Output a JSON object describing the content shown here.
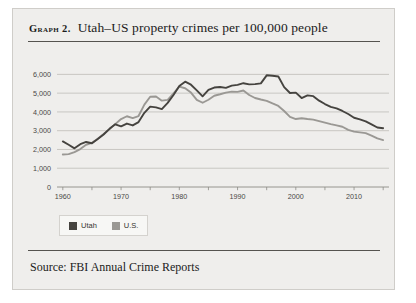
{
  "figure": {
    "label_prefix": "Graph 2.",
    "title": "Utah–US property crimes per 100,000 people",
    "source": "Source: FBI Annual Crime Reports",
    "background_color": "#efeeec",
    "rule_color": "#55534f"
  },
  "legend": {
    "position": "below-plot-left",
    "items": [
      {
        "label": "Utah",
        "color": "#45433f"
      },
      {
        "label": "U.S.",
        "color": "#9a9894"
      }
    ]
  },
  "chart_data": {
    "type": "line",
    "title": "Utah–US property crimes per 100,000 people",
    "xlabel": "",
    "ylabel": "",
    "xlim": [
      1959,
      2016
    ],
    "ylim": [
      0,
      6500
    ],
    "grid": "horizontal",
    "y_ticks": [
      0,
      1000,
      2000,
      3000,
      4000,
      5000,
      6000
    ],
    "y_tick_labels": [
      "0",
      "1,000",
      "2,000",
      "3,000",
      "4,000",
      "5,000",
      "6,000"
    ],
    "x_ticks": [
      1960,
      1970,
      1980,
      1990,
      2000,
      2010
    ],
    "x_tick_labels": [
      "1960",
      "1970",
      "1980",
      "1990",
      "2000",
      "2010"
    ],
    "x": [
      1960,
      1961,
      1962,
      1963,
      1964,
      1965,
      1966,
      1967,
      1968,
      1969,
      1970,
      1971,
      1972,
      1973,
      1974,
      1975,
      1976,
      1977,
      1978,
      1979,
      1980,
      1981,
      1982,
      1983,
      1984,
      1985,
      1986,
      1987,
      1988,
      1989,
      1990,
      1991,
      1992,
      1993,
      1994,
      1995,
      1996,
      1997,
      1998,
      1999,
      2000,
      2001,
      2002,
      2003,
      2004,
      2005,
      2006,
      2007,
      2008,
      2009,
      2010,
      2011,
      2012,
      2013,
      2014,
      2015
    ],
    "series": [
      {
        "name": "Utah",
        "color": "#45433f",
        "values": [
          2430,
          2250,
          2060,
          2280,
          2400,
          2330,
          2560,
          2800,
          3100,
          3340,
          3230,
          3380,
          3280,
          3460,
          3950,
          4280,
          4240,
          4150,
          4480,
          4900,
          5380,
          5610,
          5450,
          5150,
          4830,
          5170,
          5300,
          5330,
          5280,
          5400,
          5440,
          5530,
          5470,
          5480,
          5520,
          5950,
          5930,
          5890,
          5320,
          5010,
          5030,
          4740,
          4880,
          4840,
          4600,
          4420,
          4270,
          4190,
          4050,
          3890,
          3690,
          3600,
          3500,
          3340,
          3170,
          3130
        ]
      },
      {
        "name": "U.S.",
        "color": "#9a9894",
        "values": [
          1730,
          1750,
          1860,
          2020,
          2250,
          2350,
          2570,
          2820,
          3070,
          3350,
          3620,
          3770,
          3670,
          3780,
          4390,
          4810,
          4820,
          4600,
          4640,
          4990,
          5350,
          5260,
          5030,
          4640,
          4490,
          4650,
          4860,
          4940,
          5030,
          5080,
          5070,
          5140,
          4900,
          4740,
          4660,
          4590,
          4450,
          4320,
          4050,
          3740,
          3620,
          3660,
          3620,
          3590,
          3510,
          3430,
          3350,
          3280,
          3210,
          3040,
          2950,
          2910,
          2870,
          2740,
          2590,
          2500
        ]
      }
    ]
  }
}
